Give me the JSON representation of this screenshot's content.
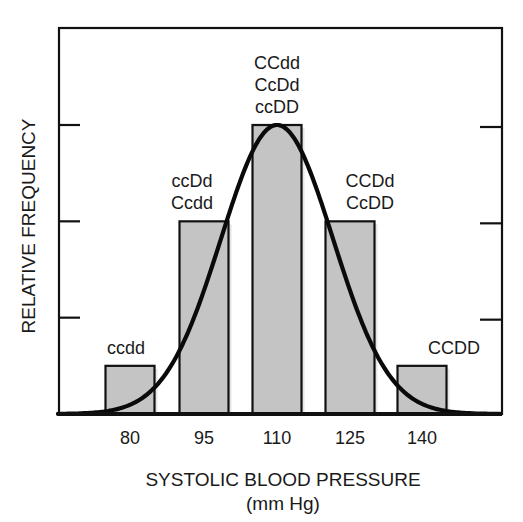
{
  "chart_data": {
    "type": "bar",
    "title": "",
    "xlabel": "SYSTOLIC BLOOD PRESSURE",
    "xlabel_unit": "(mm Hg)",
    "ylabel": "RELATIVE FREQUENCY",
    "categories": [
      "80",
      "95",
      "110",
      "125",
      "140"
    ],
    "values": [
      1,
      4,
      6,
      4,
      1
    ],
    "ylim": [
      0,
      6.2
    ],
    "y_ticks": [
      2,
      4,
      6
    ],
    "y_tick_labels_shown": false,
    "bar_labels": [
      [
        "ccdd"
      ],
      [
        "ccDd",
        "Ccdd"
      ],
      [
        "CCdd",
        "CcDd",
        "ccDD"
      ],
      [
        "CCDd",
        "CcDD"
      ],
      [
        "CCDD"
      ]
    ],
    "overlay": {
      "type": "normal-curve",
      "peak_category": "110"
    },
    "legend": null,
    "grid": false
  },
  "style": {
    "bar_fill": "#c4c4c4",
    "bar_stroke": "#111111",
    "axis_color": "#111111",
    "curve_color": "#0a0a0a"
  }
}
